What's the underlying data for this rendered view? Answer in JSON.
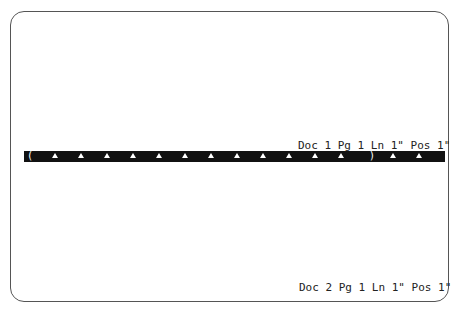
{
  "window": {
    "doc1_status": "Doc 1 Pg 1 Ln 1\" Pos 1\"",
    "doc2_status": "Doc 2 Pg 1 Ln 1\" Pos 1\""
  },
  "ruler": {
    "left_margin": "(",
    "right_margin": ")",
    "tab_positions_px": [
      28,
      54,
      80,
      106,
      132,
      158,
      184,
      210,
      236,
      262,
      288,
      314,
      366,
      392
    ]
  },
  "colors": {
    "ruler_bg": "#111111",
    "ruler_fg": "#ffffff",
    "text": "#222222",
    "frame": "#555555"
  }
}
